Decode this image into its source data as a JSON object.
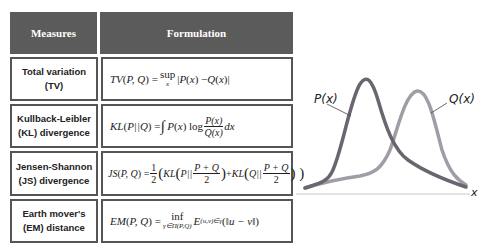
{
  "table": {
    "headers": {
      "measures": "Measures",
      "formulation": "Formulation"
    },
    "rows": [
      {
        "measure_line1": "Total variation",
        "measure_line2": "(TV)",
        "formula": "TV(P,Q) = sup_x |P(x) − Q(x)|"
      },
      {
        "measure_line1": "Kullback-Leibler",
        "measure_line2": "(KL) divergence",
        "formula": "KL(P||Q) = ∫ P(x) log P(x)/Q(x) dx"
      },
      {
        "measure_line1": "Jensen-Shannon",
        "measure_line2": "(JS) divergence",
        "formula": "JS(P,Q) = 1/2 ( KL( P|| (P+Q)/2 ) + KL( Q|| (P+Q)/2 ) )"
      },
      {
        "measure_line1": "Earth mover's",
        "measure_line2": "(EM) distance",
        "formula": "EM(P,Q) = inf_{γ∈Π(P,Q)} E_{(u,v)∈γ}(||u − v||)"
      }
    ]
  },
  "diagram": {
    "p_label": "P(x)",
    "q_label": "Q(x)",
    "x_label": "x",
    "colors": {
      "p_curve": "#6b6570",
      "q_curve": "#a19ca6",
      "axis": "#c8c8c8"
    }
  }
}
